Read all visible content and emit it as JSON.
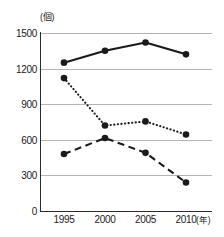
{
  "chart_data": {
    "type": "line",
    "title": "",
    "xlabel": "年",
    "ylabel": "個",
    "x_unit_label": "(年)",
    "y_unit_label": "(個)",
    "categories": [
      "1995",
      "2000",
      "2005",
      "2010"
    ],
    "x_values": [
      1995,
      2000,
      2005,
      2010
    ],
    "xlim": [
      1993.5,
      2011.5
    ],
    "ylim": [
      0,
      1500
    ],
    "y_ticks": [
      0,
      300,
      600,
      900,
      1200,
      1500
    ],
    "y_tick_labels": [
      "0",
      "300",
      "600",
      "900",
      "1200",
      "1500"
    ],
    "x_tick_labels": [
      "1995",
      "2000",
      "2005",
      "2010"
    ],
    "grid": true,
    "grid_axis": "y",
    "grid_color": "#b4b4b4",
    "legend": false,
    "legend_position": "none",
    "marker": "filled-circle",
    "series": [
      {
        "name": "series-solid",
        "linestyle": "solid",
        "color": "#1a1a1a",
        "values": [
          1250,
          1350,
          1420,
          1320
        ]
      },
      {
        "name": "series-dotted",
        "linestyle": "dotted",
        "color": "#1a1a1a",
        "values": [
          1120,
          720,
          755,
          645
        ]
      },
      {
        "name": "series-dashed",
        "linestyle": "dashed",
        "color": "#1a1a1a",
        "values": [
          480,
          615,
          490,
          240
        ]
      }
    ]
  }
}
